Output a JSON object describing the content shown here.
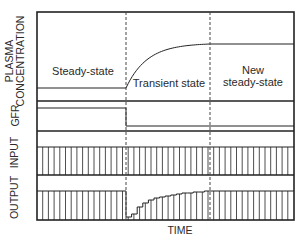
{
  "figure": {
    "x_axis_label": "TIME",
    "panels": [
      {
        "id": "plasma",
        "label_lines": [
          "PLASMA",
          "CONCENTRATION"
        ]
      },
      {
        "id": "gfr",
        "label_lines": [
          "GFR"
        ]
      },
      {
        "id": "input",
        "label_lines": [
          "INPUT"
        ]
      },
      {
        "id": "output",
        "label_lines": [
          "OUTPUT"
        ]
      }
    ],
    "phase_labels": {
      "steady": "Steady-state",
      "transient": "Transient state",
      "new_steady_line1": "New",
      "new_steady_line2": "steady-state"
    },
    "colors": {
      "line": "#222222",
      "dashed": "#444444",
      "background": "#ffffff"
    }
  },
  "geometry": {
    "frame": {
      "left": 37,
      "right": 294,
      "top": 12,
      "bottom": 220
    },
    "dividers_y": [
      101,
      131,
      175
    ],
    "phase_x": [
      126,
      210
    ],
    "plasma": {
      "steady_y": 88,
      "new_steady_y": 44
    },
    "gfr": {
      "before_y": 108,
      "after_y": 126
    },
    "input": {
      "bar_top_y": 147,
      "bar_bottom_y": 175
    },
    "output": {
      "bar_top_y": 191,
      "bar_bottom_y": 220,
      "transient_steps_y": [
        217,
        214,
        207,
        203,
        200,
        198,
        197,
        196,
        195,
        194,
        193,
        193,
        192,
        192,
        191
      ]
    },
    "bar_spacing": 5.7
  }
}
